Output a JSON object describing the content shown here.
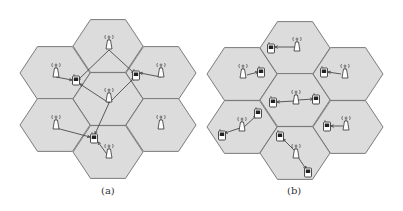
{
  "figure": {
    "panels": [
      {
        "id": "a",
        "caption": "(a)",
        "hex_fill": "#dcdcdc",
        "hex_stroke": "#6e6e6e",
        "cells": [
          {
            "cx": 108,
            "cy": 46
          },
          {
            "cx": 55,
            "cy": 73
          },
          {
            "cx": 161,
            "cy": 73
          },
          {
            "cx": 108,
            "cy": 99
          },
          {
            "cx": 55,
            "cy": 125
          },
          {
            "cx": 161,
            "cy": 125
          },
          {
            "cx": 108,
            "cy": 152
          }
        ],
        "towers": [
          {
            "x": 109,
            "y": 42
          },
          {
            "x": 56,
            "y": 70
          },
          {
            "x": 161,
            "y": 70
          },
          {
            "x": 109,
            "y": 95
          },
          {
            "x": 56,
            "y": 122
          },
          {
            "x": 161,
            "y": 122
          },
          {
            "x": 109,
            "y": 151
          }
        ],
        "phones": [
          {
            "x": 76,
            "y": 80
          },
          {
            "x": 136,
            "y": 75
          },
          {
            "x": 94,
            "y": 138
          }
        ],
        "links": [
          [
            109,
            50,
            78,
            80
          ],
          [
            109,
            50,
            134,
            73
          ],
          [
            56,
            77,
            72,
            80
          ],
          [
            109,
            103,
            80,
            84
          ],
          [
            109,
            103,
            134,
            78
          ],
          [
            161,
            77,
            140,
            73
          ],
          [
            109,
            103,
            95,
            134
          ],
          [
            56,
            128,
            90,
            137
          ],
          [
            109,
            157,
            98,
            142
          ]
        ]
      },
      {
        "id": "b",
        "caption": "(b)",
        "hex_fill": "#dcdcdc",
        "hex_stroke": "#6e6e6e",
        "cells": [
          {
            "cx": 295,
            "cy": 48
          },
          {
            "cx": 242,
            "cy": 74
          },
          {
            "cx": 348,
            "cy": 74
          },
          {
            "cx": 295,
            "cy": 100
          },
          {
            "cx": 242,
            "cy": 127
          },
          {
            "cx": 348,
            "cy": 127
          },
          {
            "cx": 295,
            "cy": 153
          }
        ],
        "towers": [
          {
            "x": 297,
            "y": 44
          },
          {
            "x": 243,
            "y": 71
          },
          {
            "x": 345,
            "y": 71
          },
          {
            "x": 296,
            "y": 97
          },
          {
            "x": 242,
            "y": 124
          },
          {
            "x": 346,
            "y": 123
          },
          {
            "x": 296,
            "y": 151
          }
        ],
        "phones": [
          {
            "x": 271,
            "y": 48
          },
          {
            "x": 261,
            "y": 72
          },
          {
            "x": 324,
            "y": 72
          },
          {
            "x": 273,
            "y": 102
          },
          {
            "x": 316,
            "y": 99
          },
          {
            "x": 258,
            "y": 113
          },
          {
            "x": 222,
            "y": 135
          },
          {
            "x": 327,
            "y": 126
          },
          {
            "x": 280,
            "y": 136
          },
          {
            "x": 308,
            "y": 172
          }
        ],
        "links": [
          [
            297,
            47,
            275,
            47
          ],
          [
            247,
            75,
            258,
            72
          ],
          [
            341,
            74,
            328,
            72
          ],
          [
            294,
            101,
            277,
            102
          ],
          [
            298,
            100,
            313,
            99
          ],
          [
            244,
            127,
            256,
            116
          ],
          [
            240,
            128,
            225,
            133
          ],
          [
            343,
            126,
            331,
            126
          ],
          [
            294,
            150,
            283,
            139
          ],
          [
            298,
            157,
            306,
            169
          ]
        ]
      }
    ]
  }
}
